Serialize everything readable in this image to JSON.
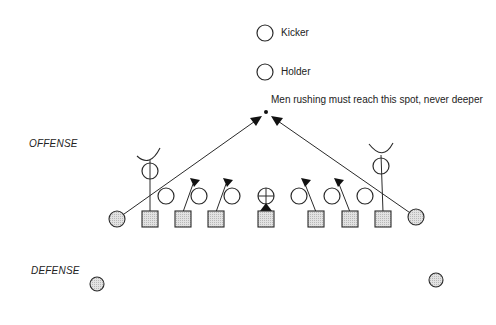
{
  "labels": {
    "kicker": "Kicker",
    "holder": "Holder",
    "spot_note": "Men rushing must reach this spot, never deeper",
    "offense": "OFFENSE",
    "defense": "DEFENSE"
  },
  "colors": {
    "stroke": "#2a2a2a",
    "shade": "#d4d4d4",
    "background": "#ffffff"
  },
  "legend": {
    "open_circle": "offensive player",
    "shaded_square": "defensive lineman",
    "shaded_circle": "defensive end / back",
    "circle_with_cross": "center"
  }
}
